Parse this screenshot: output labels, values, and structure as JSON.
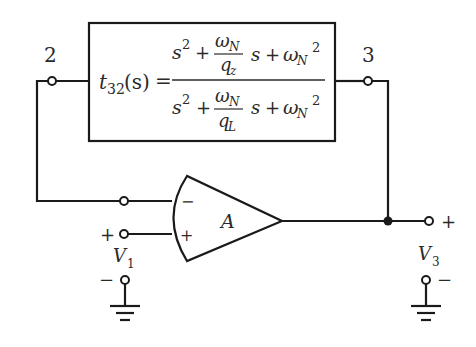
{
  "diagram": {
    "type": "circuit-schematic",
    "nodes": {
      "node2": "2",
      "node3": "3"
    },
    "block": {
      "lhs_func": "t",
      "lhs_sub": "32",
      "lhs_arg": "(s)",
      "equals": "=",
      "numerator": {
        "s": "s",
        "sq": "2",
        "plus1": "+",
        "frac_top": "ω",
        "frac_top_sub": "N",
        "frac_bot": "q",
        "frac_bot_sub": "z",
        "s_term": "s",
        "plus2": "+",
        "w": "ω",
        "w_sub": "N",
        "w_sq": "2"
      },
      "denominator": {
        "s": "s",
        "sq": "2",
        "plus1": "+",
        "frac_top": "ω",
        "frac_top_sub": "N",
        "frac_bot": "q",
        "frac_bot_sub": "L",
        "s_term": "s",
        "plus2": "+",
        "w": "ω",
        "w_sub": "N",
        "w_sq": "2"
      }
    },
    "opamp": {
      "gain": "A",
      "inv_input": "−",
      "noninv_input": "+"
    },
    "input": {
      "label": "V",
      "sub": "1",
      "plus": "+",
      "minus": "−"
    },
    "output": {
      "label": "V",
      "sub": "3",
      "plus": "+",
      "minus": "−"
    }
  }
}
